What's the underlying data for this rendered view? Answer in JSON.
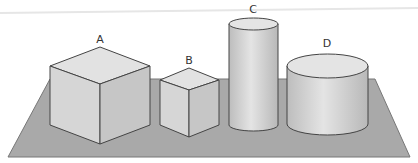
{
  "diagram": {
    "shapes": [
      {
        "id": "A",
        "label": "A",
        "type": "cube",
        "size": "large"
      },
      {
        "id": "B",
        "label": "B",
        "type": "cube",
        "size": "small"
      },
      {
        "id": "C",
        "label": "C",
        "type": "cylinder",
        "size": "tall narrow"
      },
      {
        "id": "D",
        "label": "D",
        "type": "cylinder",
        "size": "short wide"
      }
    ],
    "colors": {
      "plane": "#aaaaaa",
      "face_top": "#e2e2e2",
      "face_left": "#d4d4d4",
      "face_right": "#c4c4c4",
      "edge": "#444444"
    }
  }
}
